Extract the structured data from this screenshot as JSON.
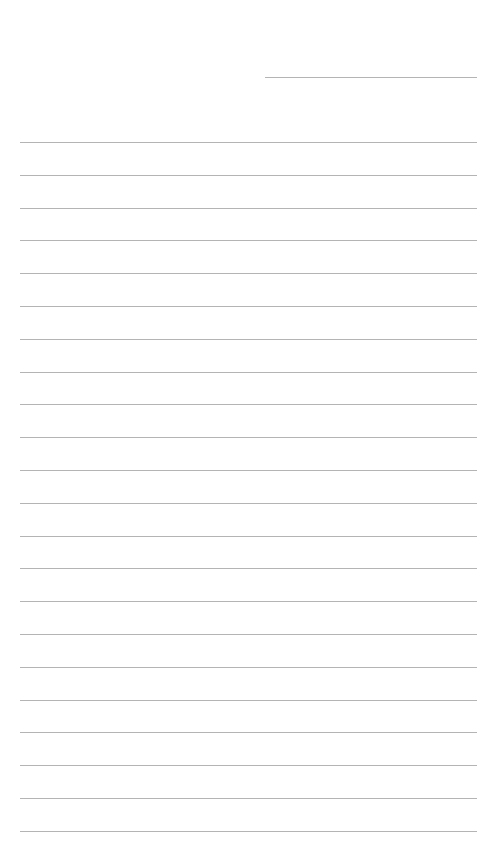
{
  "page": {
    "type": "lined-paper",
    "background_color": "#ffffff",
    "line_color": "#b4b4b4"
  },
  "header_line": {
    "x_start": 265,
    "x_end": 477,
    "y": 77
  },
  "writing_lines": {
    "count": 22,
    "x_start": 20,
    "x_end": 477,
    "first_y": 142,
    "spacing": 32.8
  }
}
